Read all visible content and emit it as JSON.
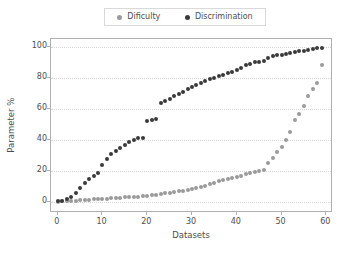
{
  "chart_data": {
    "type": "scatter",
    "title": "",
    "xlabel": "Datasets",
    "ylabel": "Parameter %",
    "xlim": [
      -1.5,
      61.5
    ],
    "ylim": [
      -7,
      105
    ],
    "xticks": [
      0,
      10,
      20,
      30,
      40,
      50,
      60
    ],
    "yticks": [
      0,
      20,
      40,
      60,
      80,
      100
    ],
    "grid": "horizontal-dotted",
    "legend_position": "upper-center-outside",
    "series": [
      {
        "name": "Dificulty",
        "color": "#9a9a9a",
        "x": [
          0,
          1,
          2,
          3,
          4,
          5,
          6,
          7,
          8,
          9,
          10,
          11,
          12,
          13,
          14,
          15,
          16,
          17,
          18,
          19,
          20,
          21,
          22,
          23,
          24,
          25,
          26,
          27,
          28,
          29,
          30,
          31,
          32,
          33,
          34,
          35,
          36,
          37,
          38,
          39,
          40,
          41,
          42,
          43,
          44,
          45,
          46,
          47,
          48,
          49,
          50,
          51,
          52,
          53,
          54,
          55,
          56,
          57,
          58,
          59
        ],
        "values": [
          0.3,
          0.5,
          0.7,
          0.9,
          1.0,
          1.2,
          1.4,
          1.5,
          1.7,
          1.8,
          2.0,
          2.2,
          2.4,
          2.6,
          2.8,
          3.0,
          3.2,
          3.4,
          3.6,
          3.9,
          4.2,
          4.5,
          4.9,
          5.2,
          5.6,
          6.0,
          6.4,
          6.9,
          7.4,
          7.9,
          8.5,
          9.2,
          9.9,
          10.7,
          11.5,
          12.4,
          13.4,
          14.5,
          15.0,
          15.6,
          16.2,
          17.0,
          17.8,
          18.6,
          19.4,
          20.2,
          21.0,
          25.0,
          28.5,
          32.0,
          35.5,
          40.0,
          45.0,
          53.0,
          57.0,
          62.0,
          68.0,
          72.5,
          77.0,
          88.0
        ]
      },
      {
        "name": "Discrimination",
        "color": "#3a3a3a",
        "x": [
          0,
          1,
          2,
          3,
          4,
          5,
          6,
          7,
          8,
          9,
          10,
          11,
          12,
          13,
          14,
          15,
          16,
          17,
          18,
          19,
          20,
          21,
          22,
          23,
          24,
          25,
          26,
          27,
          28,
          29,
          30,
          31,
          32,
          33,
          34,
          35,
          36,
          37,
          38,
          39,
          40,
          41,
          42,
          43,
          44,
          45,
          46,
          47,
          48,
          49,
          50,
          51,
          52,
          53,
          54,
          55,
          56,
          57,
          58,
          59
        ],
        "values": [
          0.5,
          1.0,
          2.0,
          3.5,
          6.0,
          9.0,
          12.0,
          15.0,
          17.0,
          18.5,
          24.0,
          28.0,
          31.0,
          33.0,
          35.0,
          37.0,
          38.5,
          40.0,
          41.0,
          41.5,
          52.0,
          53.0,
          53.5,
          64.0,
          65.0,
          66.5,
          68.0,
          69.5,
          71.0,
          72.5,
          74.0,
          75.5,
          77.0,
          78.0,
          79.0,
          80.0,
          81.0,
          82.0,
          83.0,
          84.0,
          85.0,
          86.5,
          88.0,
          89.0,
          90.0,
          90.5,
          91.0,
          93.0,
          94.0,
          94.5,
          95.0,
          95.5,
          96.0,
          96.5,
          97.0,
          97.5,
          98.0,
          98.5,
          99.0,
          99.5
        ]
      }
    ]
  },
  "legend": {
    "entries": [
      {
        "label": "Dificulty",
        "marker": "circle-marker",
        "color": "#9a9a9a"
      },
      {
        "label": "Discrimination",
        "marker": "circle-marker",
        "color": "#3a3a3a"
      }
    ]
  },
  "axes": {
    "x_title": "Datasets",
    "y_title": "Parameter %",
    "x_tick_labels": [
      "0",
      "10",
      "20",
      "30",
      "40",
      "50",
      "60"
    ],
    "y_tick_labels": [
      "0",
      "20",
      "40",
      "60",
      "80",
      "100"
    ]
  }
}
